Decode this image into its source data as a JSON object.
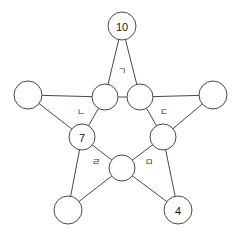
{
  "diagram": {
    "type": "pentagram-star-graph",
    "background_color": "#ffffff",
    "stroke_color": "#4a4a4a",
    "text_color": "#1a1a1a",
    "outer_nodes": [
      {
        "id": "outer-top",
        "label": "10",
        "cx": 122,
        "cy": 26,
        "r": 14
      },
      {
        "id": "outer-left",
        "label": "",
        "cx": 28,
        "cy": 95,
        "r": 14
      },
      {
        "id": "outer-right",
        "label": "",
        "cx": 213,
        "cy": 95,
        "r": 14
      },
      {
        "id": "outer-bottom-left",
        "label": "",
        "cx": 68,
        "cy": 210,
        "r": 14
      },
      {
        "id": "outer-bottom-right",
        "label": "4",
        "cx": 178,
        "cy": 210,
        "r": 14
      }
    ],
    "inner_nodes": [
      {
        "id": "inner-top-left",
        "label": "",
        "cx": 105,
        "cy": 97,
        "r": 13
      },
      {
        "id": "inner-top-right",
        "label": "",
        "cx": 140,
        "cy": 97,
        "r": 13
      },
      {
        "id": "inner-right",
        "label": "",
        "cx": 163,
        "cy": 137,
        "r": 13
      },
      {
        "id": "inner-left",
        "label": "7",
        "cx": 82,
        "cy": 137,
        "r": 13
      },
      {
        "id": "inner-bottom",
        "label": "",
        "cx": 122,
        "cy": 168,
        "r": 13
      }
    ],
    "region_labels": [
      {
        "id": "region-top",
        "label": "ㄱ",
        "x": 122,
        "y": 71
      },
      {
        "id": "region-left",
        "label": "ㄴ",
        "x": 81,
        "y": 112
      },
      {
        "id": "region-right",
        "label": "ㄷ",
        "x": 164,
        "y": 112
      },
      {
        "id": "region-bottom-left",
        "label": "ㄹ",
        "x": 96,
        "y": 162
      },
      {
        "id": "region-bottom-right",
        "label": "ㅁ",
        "x": 149,
        "y": 162
      }
    ],
    "edges": [
      {
        "id": "edge-outer-top-to-inner-top-left",
        "x1": 122,
        "y1": 26,
        "x2": 105,
        "y2": 97
      },
      {
        "id": "edge-outer-top-to-inner-top-right",
        "x1": 122,
        "y1": 26,
        "x2": 140,
        "y2": 97
      },
      {
        "id": "edge-inner-top-left-to-inner-top-right",
        "x1": 105,
        "y1": 97,
        "x2": 140,
        "y2": 97
      },
      {
        "id": "edge-outer-left-to-inner-top-left",
        "x1": 28,
        "y1": 95,
        "x2": 105,
        "y2": 97
      },
      {
        "id": "edge-outer-left-to-inner-left",
        "x1": 28,
        "y1": 95,
        "x2": 82,
        "y2": 137
      },
      {
        "id": "edge-inner-top-left-to-inner-left",
        "x1": 105,
        "y1": 97,
        "x2": 82,
        "y2": 137
      },
      {
        "id": "edge-outer-right-to-inner-top-right",
        "x1": 213,
        "y1": 95,
        "x2": 140,
        "y2": 97
      },
      {
        "id": "edge-outer-right-to-inner-right",
        "x1": 213,
        "y1": 95,
        "x2": 163,
        "y2": 137
      },
      {
        "id": "edge-inner-top-right-to-inner-right",
        "x1": 140,
        "y1": 97,
        "x2": 163,
        "y2": 137
      },
      {
        "id": "edge-inner-left-to-inner-bottom",
        "x1": 82,
        "y1": 137,
        "x2": 122,
        "y2": 168
      },
      {
        "id": "edge-inner-right-to-inner-bottom",
        "x1": 163,
        "y1": 137,
        "x2": 122,
        "y2": 168
      },
      {
        "id": "edge-inner-left-to-outer-bottom-left",
        "x1": 82,
        "y1": 137,
        "x2": 68,
        "y2": 210
      },
      {
        "id": "edge-inner-bottom-to-outer-bottom-left",
        "x1": 122,
        "y1": 168,
        "x2": 68,
        "y2": 210
      },
      {
        "id": "edge-inner-right-to-outer-bottom-right",
        "x1": 163,
        "y1": 137,
        "x2": 178,
        "y2": 210
      },
      {
        "id": "edge-inner-bottom-to-outer-bottom-right",
        "x1": 122,
        "y1": 168,
        "x2": 178,
        "y2": 210
      }
    ]
  }
}
